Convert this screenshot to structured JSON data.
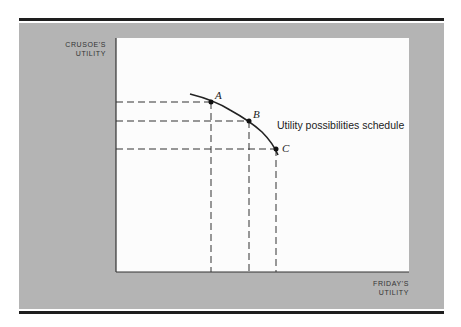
{
  "figure": {
    "y_axis_label_line1": "CRUSOE'S",
    "y_axis_label_line2": "UTILITY",
    "x_axis_label_line1": "FRIDAY'S",
    "x_axis_label_line2": "UTILITY",
    "curve_label": "Utility possibilities schedule",
    "points": [
      {
        "label": "A",
        "x": 211,
        "y": 102
      },
      {
        "label": "B",
        "x": 249,
        "y": 121
      },
      {
        "label": "C",
        "x": 276,
        "y": 149
      }
    ],
    "colors": {
      "panel": "#b4b4b4",
      "plot_background": "#fcfcfc",
      "rule": "#1e1e1e",
      "line": "#222222"
    }
  }
}
